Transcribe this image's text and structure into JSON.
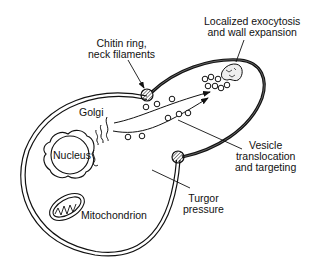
{
  "diagram": {
    "type": "cell-biology-schematic",
    "colors": {
      "ink": "#111111",
      "background": "#ffffff"
    },
    "labels": {
      "chitin_ring": [
        "Chitin ring,",
        "neck filaments"
      ],
      "exocytosis": [
        "Localized exocytosis",
        "and wall expansion"
      ],
      "golgi": "Golgi",
      "nucleus": "Nucleus",
      "vesicle": [
        "Vesicle",
        "translocation",
        "and targeting"
      ],
      "mitochondrion": "Mitochondrion",
      "turgor": [
        "Turgor",
        "pressure"
      ]
    },
    "components": [
      "mother-cell",
      "bud",
      "chitin-ring-upper",
      "chitin-ring-lower",
      "exocytosis-patch",
      "golgi",
      "nucleus",
      "mitochondrion",
      "vesicles",
      "transport-arrows"
    ]
  }
}
